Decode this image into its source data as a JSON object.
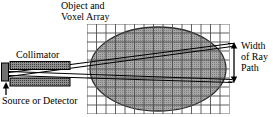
{
  "figure": {
    "name": "tomography-ray-path-diagram",
    "width": 273,
    "height": 117,
    "background_color": "#ffffff",
    "stroke_color": "#000000"
  },
  "labels": {
    "object_title": "Object and\nVoxel Array",
    "collimator": "Collimator",
    "source_or_detector": "Source or Detector",
    "width_of_ray_path": "Width\nof Ray\nPath"
  },
  "elements": {
    "voxel_grid": {
      "name": "voxel-grid",
      "x": 87,
      "y": 24,
      "columns": 15,
      "rows": 10,
      "cell_width": 9.5,
      "cell_height": 9,
      "line_color": "#4a4a4a",
      "fill_color": "#ffffff"
    },
    "object_ellipse": {
      "name": "object-ellipse",
      "center_x": 158,
      "center_y": 69,
      "radius_x": 68,
      "radius_y": 42,
      "fill_color": "#9a9a9a",
      "stroke_color": "#3a3a3a"
    },
    "collimator_upper_bar": {
      "name": "collimator-upper-bar",
      "x": 10,
      "y": 62,
      "width": 60,
      "height": 8,
      "fill_color": "#8c8c8c",
      "stroke_color": "#000000"
    },
    "collimator_lower_bar": {
      "name": "collimator-lower-bar",
      "x": 10,
      "y": 78,
      "width": 60,
      "height": 8,
      "fill_color": "#8c8c8c",
      "stroke_color": "#000000"
    },
    "source_detector_block": {
      "name": "source-detector-block",
      "x": 2,
      "y": 63,
      "width": 7,
      "height": 18,
      "fill_color": "#6e6e6e",
      "stroke_color": "#000000"
    },
    "source_pointer_arrow": {
      "name": "source-pointer-arrow",
      "x": 6,
      "y_from": 95,
      "y_to": 84
    },
    "width_dimension_arrow": {
      "name": "width-dimension-arrow",
      "x": 234,
      "y_top": 43,
      "y_bottom": 82
    },
    "ray_lines": [
      {
        "name": "ray-upper-outer",
        "x1": 9,
        "y1": 73,
        "x2": 232,
        "y2": 44
      },
      {
        "name": "ray-upper-inner",
        "x1": 9,
        "y1": 76,
        "x2": 232,
        "y2": 46
      },
      {
        "name": "ray-lower-inner",
        "x1": 9,
        "y1": 72,
        "x2": 232,
        "y2": 80
      },
      {
        "name": "ray-lower-outer",
        "x1": 9,
        "y1": 75,
        "x2": 232,
        "y2": 82
      }
    ]
  }
}
